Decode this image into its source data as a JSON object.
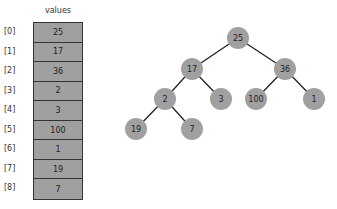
{
  "array": {
    "header": "values",
    "cells": [
      {
        "index": "[0]",
        "value": "25"
      },
      {
        "index": "[1]",
        "value": "17"
      },
      {
        "index": "[2]",
        "value": "36"
      },
      {
        "index": "[3]",
        "value": "2"
      },
      {
        "index": "[4]",
        "value": "3"
      },
      {
        "index": "[5]",
        "value": "100"
      },
      {
        "index": "[6]",
        "value": "1"
      },
      {
        "index": "[7]",
        "value": "19"
      },
      {
        "index": "[8]",
        "value": "7"
      }
    ]
  },
  "tree": {
    "nodes": [
      {
        "id": 0,
        "value": "25"
      },
      {
        "id": 1,
        "value": "17"
      },
      {
        "id": 2,
        "value": "36"
      },
      {
        "id": 3,
        "value": "2"
      },
      {
        "id": 4,
        "value": "3"
      },
      {
        "id": 5,
        "value": "100"
      },
      {
        "id": 6,
        "value": "1"
      },
      {
        "id": 7,
        "value": "19"
      },
      {
        "id": 8,
        "value": "7"
      }
    ]
  },
  "colors": {
    "cell_fill": "#a0a0a0",
    "node_fill": "#a0a0a0",
    "edge": "#222222"
  }
}
